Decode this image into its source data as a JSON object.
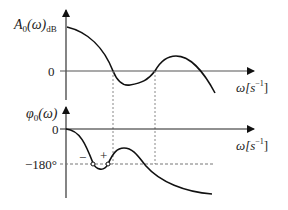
{
  "diagram": {
    "top_plot": {
      "y_label_main": "A",
      "y_label_sub": "0",
      "y_label_arg": "(ω)",
      "y_label_unit": "dB",
      "zero_label": "0",
      "x_label_main": "ω[s",
      "x_label_exp": "−1",
      "x_label_close": "]"
    },
    "bottom_plot": {
      "y_label_main": "φ",
      "y_label_sub": "0",
      "y_label_arg": "(ω)",
      "zero_label": "0",
      "minus180_label": "−180°",
      "minus_marker": "−",
      "plus_marker": "+",
      "x_label_main": "ω[s",
      "x_label_exp": "−1",
      "x_label_close": "]"
    },
    "colors": {
      "curve": "#111111",
      "axis": "#333333",
      "guide": "#888888"
    }
  }
}
